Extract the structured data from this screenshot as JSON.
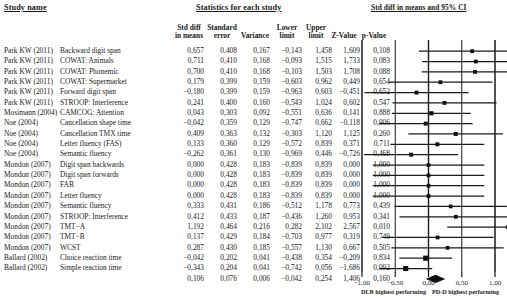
{
  "headers": {
    "study_name": "Study name",
    "statistics": "Statistics for each study",
    "plot": "Std diff in means and 95% CI"
  },
  "columns": [
    {
      "key": "std_diff",
      "lines": [
        "Std diff",
        "in means"
      ]
    },
    {
      "key": "std_error",
      "lines": [
        "Standard",
        "error"
      ]
    },
    {
      "key": "variance",
      "lines": [
        "",
        "Variance"
      ]
    },
    {
      "key": "lower",
      "lines": [
        "Lower",
        "limit"
      ]
    },
    {
      "key": "upper",
      "lines": [
        "Upper",
        "limit"
      ]
    },
    {
      "key": "z",
      "lines": [
        "",
        "Z-Value"
      ]
    },
    {
      "key": "p",
      "lines": [
        "",
        "p-Value"
      ]
    }
  ],
  "rows": [
    {
      "study": "Park KW (2011)",
      "outcome": "Backward digit span",
      "std_diff": "0,657",
      "std_error": "0,408",
      "variance": "0,167",
      "lower": "−0,143",
      "upper": "1,458",
      "z": "1,609",
      "p": "0,108",
      "v": {
        "e": 0.657,
        "l": -0.143,
        "u": 1.458,
        "w": 0.3
      }
    },
    {
      "study": "Park KW (2011)",
      "outcome": "COWAT: Animals",
      "std_diff": "0,711",
      "std_error": "0,410",
      "variance": "0,168",
      "lower": "−0,093",
      "upper": "1,515",
      "z": "1,733",
      "p": "0,083",
      "v": {
        "e": 0.711,
        "l": -0.093,
        "u": 1.515,
        "w": 0.3
      }
    },
    {
      "study": "Park KW (2011)",
      "outcome": "COWAT: Phonemic",
      "std_diff": "0,700",
      "std_error": "0,410",
      "variance": "0,168",
      "lower": "−0,103",
      "upper": "1,503",
      "z": "1,708",
      "p": "0,088",
      "v": {
        "e": 0.7,
        "l": -0.103,
        "u": 1.503,
        "w": 0.3
      }
    },
    {
      "study": "Park KW (2011)",
      "outcome": "COWAT: Supermarket",
      "std_diff": "0,179",
      "std_error": "0,399",
      "variance": "0,159",
      "lower": "−0,603",
      "upper": "0,962",
      "z": "0,449",
      "p": "0,654",
      "v": {
        "e": 0.179,
        "l": -0.603,
        "u": 0.962,
        "w": 0.31
      }
    },
    {
      "study": "Park KW (2011)",
      "outcome": "Forward digit span",
      "std_diff": "−0,180",
      "std_error": "0,399",
      "variance": "0,159",
      "lower": "−0,963",
      "upper": "0,603",
      "z": "−0,451",
      "p": "0,652",
      "v": {
        "e": -0.18,
        "l": -0.963,
        "u": 0.603,
        "w": 0.31
      }
    },
    {
      "study": "Park KW (2011)",
      "outcome": "STROOP: Interference",
      "std_diff": "0,241",
      "std_error": "0,400",
      "variance": "0,160",
      "lower": "−0,543",
      "upper": "1,024",
      "z": "0,602",
      "p": "0,547",
      "v": {
        "e": 0.241,
        "l": -0.543,
        "u": 1.024,
        "w": 0.31
      }
    },
    {
      "study": "Mosimann (2004)",
      "outcome": "CAMCOG: Attention",
      "std_diff": "0,043",
      "std_error": "0,303",
      "variance": "0,092",
      "lower": "−0,551",
      "upper": "0,636",
      "z": "0,141",
      "p": "0,888",
      "v": {
        "e": 0.043,
        "l": -0.551,
        "u": 0.636,
        "w": 0.36
      }
    },
    {
      "study": "Noe (2004)",
      "outcome": "Cancellation shape time",
      "std_diff": "−0,042",
      "std_error": "0,359",
      "variance": "0,129",
      "lower": "−0,747",
      "upper": "0,662",
      "z": "−0,118",
      "p": "0,906",
      "v": {
        "e": -0.042,
        "l": -0.747,
        "u": 0.662,
        "w": 0.33
      }
    },
    {
      "study": "Noe (2004)",
      "outcome": "Cancellation TMX time",
      "std_diff": "0,409",
      "std_error": "0,363",
      "variance": "0,132",
      "lower": "−0,303",
      "upper": "1,120",
      "z": "1,125",
      "p": "0,260",
      "v": {
        "e": 0.409,
        "l": -0.303,
        "u": 1.12,
        "w": 0.33
      }
    },
    {
      "study": "Noe (2004)",
      "outcome": "Letter fluency (FAS)",
      "std_diff": "0,133",
      "std_error": "0,360",
      "variance": "0,129",
      "lower": "−0,572",
      "upper": "0,839",
      "z": "0,371",
      "p": "0,711",
      "v": {
        "e": 0.133,
        "l": -0.572,
        "u": 0.839,
        "w": 0.33
      }
    },
    {
      "study": "Noe (2004)",
      "outcome": "Semantic fluency",
      "std_diff": "−0,262",
      "std_error": "0,361",
      "variance": "0,130",
      "lower": "−0,969",
      "upper": "0,446",
      "z": "−0,726",
      "p": "0,468",
      "v": {
        "e": -0.262,
        "l": -0.969,
        "u": 0.446,
        "w": 0.33
      }
    },
    {
      "study": "Mondon (2007)",
      "outcome": "Digit span backwards",
      "std_diff": "0,000",
      "std_error": "0,428",
      "variance": "0,183",
      "lower": "−0,839",
      "upper": "0,839",
      "z": "0,000",
      "p": "1,000",
      "v": {
        "e": 0.0,
        "l": -0.839,
        "u": 0.839,
        "w": 0.29
      }
    },
    {
      "study": "Mondon (2007)",
      "outcome": "Digit span forwards",
      "std_diff": "0,000",
      "std_error": "0,428",
      "variance": "0,183",
      "lower": "−0,839",
      "upper": "0,839",
      "z": "0,000",
      "p": "1,000",
      "v": {
        "e": 0.0,
        "l": -0.839,
        "u": 0.839,
        "w": 0.29
      }
    },
    {
      "study": "Mondon (2007)",
      "outcome": "FAB",
      "std_diff": "0,000",
      "std_error": "0,428",
      "variance": "0,183",
      "lower": "−0,839",
      "upper": "0,839",
      "z": "0,000",
      "p": "1,000",
      "v": {
        "e": 0.0,
        "l": -0.839,
        "u": 0.839,
        "w": 0.29
      }
    },
    {
      "study": "Mondon (2007)",
      "outcome": "Letter fluency",
      "std_diff": "0,000",
      "std_error": "0,428",
      "variance": "0,183",
      "lower": "−0,839",
      "upper": "0,839",
      "z": "0,000",
      "p": "1,000",
      "v": {
        "e": 0.0,
        "l": -0.839,
        "u": 0.839,
        "w": 0.29
      }
    },
    {
      "study": "Mondon (2007)",
      "outcome": "Semantic fluency",
      "std_diff": "0,333",
      "std_error": "0,431",
      "variance": "0,186",
      "lower": "−0,512",
      "upper": "1,178",
      "z": "0,773",
      "p": "0,439",
      "v": {
        "e": 0.333,
        "l": -0.512,
        "u": 1.178,
        "w": 0.29
      }
    },
    {
      "study": "Mondon (2007)",
      "outcome": "STROOP: Interference",
      "std_diff": "0,412",
      "std_error": "0,433",
      "variance": "0,187",
      "lower": "−0,436",
      "upper": "1,260",
      "z": "0,953",
      "p": "0,341",
      "v": {
        "e": 0.412,
        "l": -0.436,
        "u": 1.26,
        "w": 0.29
      }
    },
    {
      "study": "Mondon (2007)",
      "outcome": "TMT−A",
      "std_diff": "1,192",
      "std_error": "0,464",
      "variance": "0,216",
      "lower": "0,282",
      "upper": "2,102",
      "z": "2,567",
      "p": "0,010",
      "v": {
        "e": 1.192,
        "l": 0.282,
        "u": 2.102,
        "w": 0.28
      }
    },
    {
      "study": "Mondon (2007)",
      "outcome": "TMT−B",
      "std_diff": "0,137",
      "std_error": "0,429",
      "variance": "0,184",
      "lower": "−0,703",
      "upper": "0,977",
      "z": "0,319",
      "p": "0,749",
      "v": {
        "e": 0.137,
        "l": -0.703,
        "u": 0.977,
        "w": 0.29
      }
    },
    {
      "study": "Mondon (2007)",
      "outcome": "WCST",
      "std_diff": "0,287",
      "std_error": "0,430",
      "variance": "0,185",
      "lower": "−0,557",
      "upper": "1,130",
      "z": "0,667",
      "p": "0,505",
      "v": {
        "e": 0.287,
        "l": -0.557,
        "u": 1.13,
        "w": 0.29
      }
    },
    {
      "study": "Ballard (2002)",
      "outcome": "Choice reaction time",
      "std_diff": "−0,042",
      "std_error": "0,202",
      "variance": "0,041",
      "lower": "−0,438",
      "upper": "0,354",
      "z": "−0,209",
      "p": "0,834",
      "v": {
        "e": -0.042,
        "l": -0.438,
        "u": 0.354,
        "w": 0.52
      }
    },
    {
      "study": "Ballard (2002)",
      "outcome": "Simple reaction time",
      "std_diff": "−0,343",
      "std_error": "0,204",
      "variance": "0,041",
      "lower": "−0,742",
      "upper": "0,056",
      "z": "−1,686",
      "p": "0,092",
      "v": {
        "e": -0.343,
        "l": -0.742,
        "u": 0.056,
        "w": 0.52
      }
    },
    {
      "study": "",
      "outcome": "",
      "std_diff": "0,106",
      "std_error": "0,076",
      "variance": "0,006",
      "lower": "−0,042",
      "upper": "0,254",
      "z": "1,406",
      "p": "0,160",
      "v": {
        "e": 0.106,
        "l": -0.042,
        "u": 0.254,
        "w": 0,
        "summary": true
      }
    }
  ],
  "axis": {
    "ticks": [
      "−1,00",
      "−0,50",
      "0,00",
      "0,50",
      "1,00"
    ],
    "tick_values": [
      -1,
      -0.5,
      0,
      0.5,
      1
    ],
    "min": -1,
    "max": 1
  },
  "footers": {
    "left": "DLB highest performing",
    "right": "PD-D highest performing"
  },
  "colors": {
    "ink": "#1a1a1a",
    "background": "#ffffff"
  },
  "chart_data": {
    "type": "forest",
    "title": "Std diff in means and 95% CI",
    "xlabel": "",
    "xlim": [
      -1,
      1
    ],
    "categories": [
      "Park KW (2011) Backward digit span",
      "Park KW (2011) COWAT: Animals",
      "Park KW (2011) COWAT: Phonemic",
      "Park KW (2011) COWAT: Supermarket",
      "Park KW (2011) Forward digit span",
      "Park KW (2011) STROOP: Interference",
      "Mosimann (2004) CAMCOG: Attention",
      "Noe (2004) Cancellation shape time",
      "Noe (2004) Cancellation TMX time",
      "Noe (2004) Letter fluency (FAS)",
      "Noe (2004) Semantic fluency",
      "Mondon (2007) Digit span backwards",
      "Mondon (2007) Digit span forwards",
      "Mondon (2007) FAB",
      "Mondon (2007) Letter fluency",
      "Mondon (2007) Semantic fluency",
      "Mondon (2007) STROOP: Interference",
      "Mondon (2007) TMT-A",
      "Mondon (2007) TMT-B",
      "Mondon (2007) WCST",
      "Ballard (2002) Choice reaction time",
      "Ballard (2002) Simple reaction time",
      "Overall"
    ],
    "effects": [
      0.657,
      0.711,
      0.7,
      0.179,
      -0.18,
      0.241,
      0.043,
      -0.042,
      0.409,
      0.133,
      -0.262,
      0.0,
      0.0,
      0.0,
      0.0,
      0.333,
      0.412,
      1.192,
      0.137,
      0.287,
      -0.042,
      -0.343,
      0.106
    ],
    "lower": [
      -0.143,
      -0.093,
      -0.103,
      -0.603,
      -0.963,
      -0.543,
      -0.551,
      -0.747,
      -0.303,
      -0.572,
      -0.969,
      -0.839,
      -0.839,
      -0.839,
      -0.839,
      -0.512,
      -0.436,
      0.282,
      -0.703,
      -0.557,
      -0.438,
      -0.742,
      -0.042
    ],
    "upper": [
      1.458,
      1.515,
      1.503,
      0.962,
      0.603,
      1.024,
      0.636,
      0.662,
      1.12,
      0.839,
      0.446,
      0.839,
      0.839,
      0.839,
      0.839,
      1.178,
      1.26,
      2.102,
      0.977,
      1.13,
      0.354,
      0.056,
      0.254
    ],
    "grid": true,
    "legend": "none"
  }
}
